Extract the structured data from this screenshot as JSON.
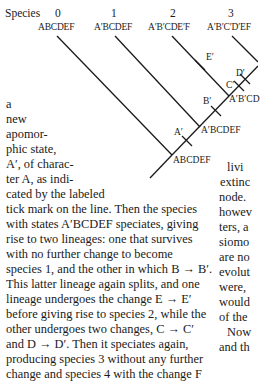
{
  "figure": {
    "species_header": "Species",
    "species": [
      {
        "number": "0",
        "states": "ABCDEF"
      },
      {
        "number": "1",
        "states": "A′BCDEF"
      },
      {
        "number": "2",
        "states": "A′B′CDE′F"
      },
      {
        "number": "3",
        "states": "A′B′C′D′EF"
      }
    ],
    "tick_labels": {
      "a": "A′",
      "b": "B′",
      "c": "C′",
      "d": "D′",
      "e": "E′"
    },
    "node_labels": {
      "root": "ABCDEF",
      "n1": "A′BCDEF",
      "n2": "A′B′CD"
    }
  },
  "left_column": {
    "narrow_lines": [
      "a",
      "new",
      "apomor-",
      "phic state,",
      "A′, of charac-",
      "ter A, as indi-",
      "cated by the labeled"
    ],
    "full_lines": [
      "tick mark on the line. Then the species",
      "with states A′BCDEF speciates, giving",
      "rise to two lineages: one that survives",
      "with no further change to become",
      "species 1, and the other in which B → B′.",
      "This latter lineage again splits, and one",
      "lineage undergoes the change E → E′",
      "before giving rise to species 2, while the",
      "other undergoes two changes, C → C′",
      "and D → D′. Then it speciates again,",
      "producing species 3 without any further",
      "change and species 4 with the change F"
    ]
  },
  "right_column": {
    "lines": [
      "livi",
      "extinc",
      "node.",
      "howev",
      "ters, a",
      "siomo",
      "are no",
      "evolut",
      "were,",
      "would",
      "of the",
      "Now",
      "and th",
      "evolve",
      "phylo"
    ]
  }
}
